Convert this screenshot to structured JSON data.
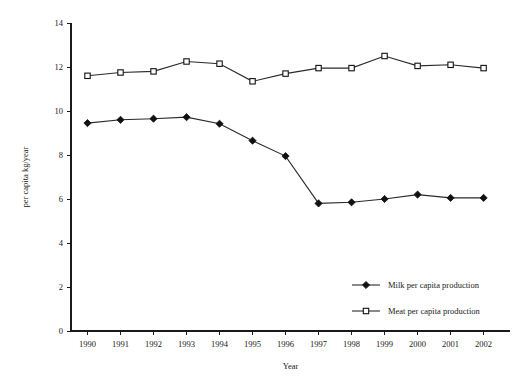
{
  "chart_data": {
    "type": "line",
    "title": "",
    "xlabel": "Year",
    "ylabel": "per capita kg/year",
    "categories": [
      "1990",
      "1991",
      "1992",
      "1993",
      "1994",
      "1995",
      "1996",
      "1997",
      "1998",
      "1999",
      "2000",
      "2001",
      "2002"
    ],
    "x": [
      1990,
      1991,
      1992,
      1993,
      1994,
      1995,
      1996,
      1997,
      1998,
      1999,
      2000,
      2001,
      2002
    ],
    "xlim": [
      1989.5,
      2002.8
    ],
    "ylim": [
      0,
      14
    ],
    "yticks": [
      0,
      2,
      4,
      6,
      8,
      10,
      12,
      14
    ],
    "ytick_labels": [
      "0",
      "2",
      "4",
      "6",
      "8",
      "10",
      "12",
      "14"
    ],
    "grid": false,
    "legend_position": "lower right",
    "series": [
      {
        "name": "Milk per capita production",
        "marker": "filled-diamond",
        "color": "#111111",
        "values": [
          9.45,
          9.6,
          9.65,
          9.72,
          9.42,
          8.65,
          7.95,
          5.8,
          5.85,
          6.0,
          6.2,
          6.05,
          6.05
        ]
      },
      {
        "name": "Meat per capita production",
        "marker": "open-square",
        "color": "#111111",
        "values": [
          11.6,
          11.75,
          11.8,
          12.25,
          12.15,
          11.35,
          11.7,
          11.95,
          11.95,
          12.5,
          12.05,
          12.1,
          11.95
        ]
      }
    ]
  },
  "legend": {
    "items": [
      {
        "label": "Milk per capita production",
        "marker": "filled-diamond"
      },
      {
        "label": "Meat per capita production",
        "marker": "open-square"
      }
    ]
  }
}
